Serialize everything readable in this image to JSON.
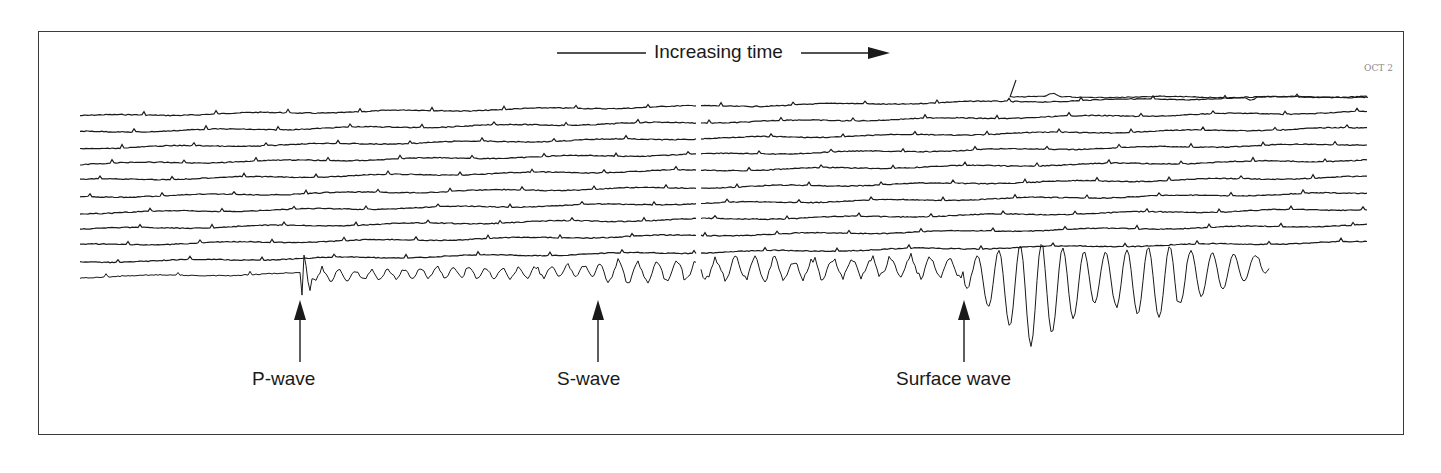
{
  "figure": {
    "time_axis": {
      "label": "Increasing time",
      "direction": "left-to-right"
    },
    "annotations": {
      "top_right_label": "OCT 2",
      "handwritten_note": "(illegible handwriting)"
    },
    "labels": [
      {
        "id": "p",
        "text": "P-wave",
        "arrow_x": 300,
        "label_x": 252
      },
      {
        "id": "s",
        "text": "S-wave",
        "arrow_x": 598,
        "label_x": 557
      },
      {
        "id": "surface",
        "text": "Surface wave",
        "arrow_x": 964,
        "label_x": 896
      }
    ],
    "traces": {
      "count": 11,
      "left_y": [
        116,
        132,
        148,
        164,
        180,
        197,
        213,
        229,
        245,
        262,
        277
      ],
      "right_y": [
        96,
        112,
        128,
        144,
        160,
        177,
        193,
        209,
        225,
        242,
        257
      ],
      "x_start": 80,
      "x_end": 1368,
      "top_trace_start_x": 1010,
      "gap_x": [
        697,
        701
      ]
    },
    "events": {
      "p_wave_x": 300,
      "s_wave_x": 598,
      "surface_wave_start_x": 965,
      "surface_wave_end_x": 1270
    },
    "colors": {
      "ink": "#1a1a1a",
      "frame": "#3a3a3a",
      "faint": "#8a8a8a"
    }
  }
}
